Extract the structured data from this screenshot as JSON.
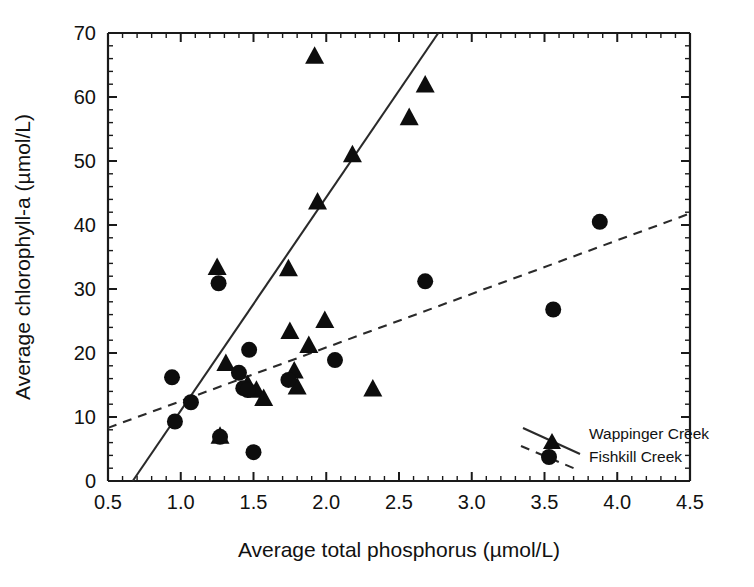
{
  "chart_data": {
    "type": "scatter",
    "title": "",
    "xlabel": "Average total phosphorus (µmol/L)",
    "ylabel": "Average chlorophyll-a (µmol/L)",
    "xlim": [
      0.5,
      4.5
    ],
    "ylim": [
      0,
      70
    ],
    "xticks": [
      0.5,
      1.0,
      1.5,
      2.0,
      2.5,
      3.0,
      3.5,
      4.0,
      4.5
    ],
    "xticklabels": [
      "0.5",
      "1.0",
      "1.5",
      "2.0",
      "2.5",
      "3.0",
      "3.5",
      "4.0",
      "4.5"
    ],
    "yticks": [
      0,
      10,
      20,
      30,
      40,
      50,
      60,
      70
    ],
    "yticklabels": [
      "0",
      "10",
      "20",
      "30",
      "40",
      "50",
      "60",
      "70"
    ],
    "minor_tick_interval_x": 0.1,
    "minor_tick_interval_y": 2,
    "grid": false,
    "legend_position": "bottom-right",
    "series": [
      {
        "name": "Wappinger Creek",
        "marker": "triangle",
        "color": "#0d0d0d",
        "fit": {
          "style": "solid",
          "x": [
            0.67,
            2.77
          ],
          "y": [
            0,
            70
          ]
        },
        "points": [
          {
            "x": 1.25,
            "y": 33.4
          },
          {
            "x": 1.27,
            "y": 7.0
          },
          {
            "x": 1.31,
            "y": 18.4
          },
          {
            "x": 1.46,
            "y": 15.1
          },
          {
            "x": 1.52,
            "y": 14.2
          },
          {
            "x": 1.57,
            "y": 12.9
          },
          {
            "x": 1.74,
            "y": 33.2
          },
          {
            "x": 1.75,
            "y": 23.4
          },
          {
            "x": 1.78,
            "y": 17.2
          },
          {
            "x": 1.8,
            "y": 14.7
          },
          {
            "x": 1.88,
            "y": 21.2
          },
          {
            "x": 1.92,
            "y": 66.4
          },
          {
            "x": 1.94,
            "y": 43.6
          },
          {
            "x": 1.99,
            "y": 25.1
          },
          {
            "x": 2.18,
            "y": 51.0
          },
          {
            "x": 2.32,
            "y": 14.4
          },
          {
            "x": 2.57,
            "y": 56.8
          },
          {
            "x": 2.68,
            "y": 61.9
          }
        ]
      },
      {
        "name": "Fishkill Creek",
        "marker": "circle",
        "color": "#0d0d0d",
        "fit": {
          "style": "dashed",
          "x": [
            0.5,
            4.5
          ],
          "y": [
            8.3,
            41.8
          ]
        },
        "points": [
          {
            "x": 0.94,
            "y": 16.2
          },
          {
            "x": 0.96,
            "y": 9.3
          },
          {
            "x": 1.07,
            "y": 12.3
          },
          {
            "x": 1.26,
            "y": 30.9
          },
          {
            "x": 1.27,
            "y": 6.9
          },
          {
            "x": 1.4,
            "y": 16.9
          },
          {
            "x": 1.43,
            "y": 14.5
          },
          {
            "x": 1.46,
            "y": 14.2
          },
          {
            "x": 1.47,
            "y": 20.5
          },
          {
            "x": 1.5,
            "y": 4.5
          },
          {
            "x": 1.74,
            "y": 15.8
          },
          {
            "x": 2.06,
            "y": 18.9
          },
          {
            "x": 2.68,
            "y": 31.2
          },
          {
            "x": 3.56,
            "y": 26.8
          },
          {
            "x": 3.88,
            "y": 40.5
          }
        ]
      }
    ],
    "legend": [
      {
        "label": "Wappinger Creek",
        "marker": "triangle",
        "line": "solid"
      },
      {
        "label": "Fishkill Creek",
        "marker": "circle",
        "line": "dashed"
      }
    ]
  }
}
